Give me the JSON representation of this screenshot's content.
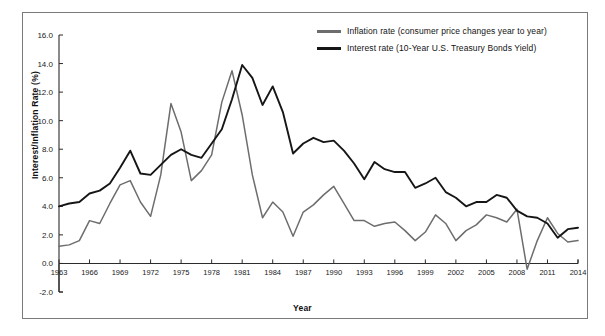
{
  "figure": {
    "background": "#ffffff",
    "border_color": "#7a7a7a",
    "top_ghost_text": ""
  },
  "axis_titles": {
    "y": "Interest/Inflation Rate (%)",
    "x": "Year"
  },
  "legend": {
    "position": "top-right-inside",
    "entries": [
      {
        "name": "inflation",
        "label": "Inflation rate (consumer price changes year to year)",
        "color": "#6d6d6d"
      },
      {
        "name": "interest",
        "label": "Interest rate (10-Year U.S. Treasury Bonds Yield)",
        "color": "#161616"
      }
    ]
  },
  "chart_data": {
    "type": "line",
    "title": "",
    "subtitle": "",
    "xlabel": "Year",
    "ylabel": "Interest/Inflation Rate (%)",
    "xlim": [
      1963,
      2014
    ],
    "ylim": [
      -2.0,
      16.0
    ],
    "ytick_labels": [
      "16.0",
      "14.0",
      "12.0",
      "10.0",
      "8.0",
      "6.0",
      "4.0",
      "2.0",
      "0.0",
      "-2.0"
    ],
    "yticks": [
      16.0,
      14.0,
      12.0,
      10.0,
      8.0,
      6.0,
      4.0,
      2.0,
      0.0,
      -2.0
    ],
    "xtick_labels": [
      "1963",
      "1966",
      "1969",
      "1972",
      "1975",
      "1978",
      "1981",
      "1984",
      "1987",
      "1990",
      "1993",
      "1996",
      "1999",
      "2002",
      "2005",
      "2008",
      "2011",
      "2014"
    ],
    "xticks": [
      1963,
      1966,
      1969,
      1972,
      1975,
      1978,
      1981,
      1984,
      1987,
      1990,
      1993,
      1996,
      1999,
      2002,
      2005,
      2008,
      2011,
      2014
    ],
    "grid": false,
    "legend_position": "top-right",
    "x": [
      1963,
      1964,
      1965,
      1966,
      1967,
      1968,
      1969,
      1970,
      1971,
      1972,
      1973,
      1974,
      1975,
      1976,
      1977,
      1978,
      1979,
      1980,
      1981,
      1982,
      1983,
      1984,
      1985,
      1986,
      1987,
      1988,
      1989,
      1990,
      1991,
      1992,
      1993,
      1994,
      1995,
      1996,
      1997,
      1998,
      1999,
      2000,
      2001,
      2002,
      2003,
      2004,
      2005,
      2006,
      2007,
      2008,
      2009,
      2010,
      2011,
      2012,
      2013,
      2014
    ],
    "series": [
      {
        "name": "Inflation rate (consumer price changes year to year)",
        "color": "#6d6d6d",
        "values": [
          1.2,
          1.3,
          1.6,
          3.0,
          2.8,
          4.2,
          5.5,
          5.8,
          4.3,
          3.3,
          6.2,
          11.2,
          9.2,
          5.8,
          6.5,
          7.6,
          11.3,
          13.5,
          10.4,
          6.2,
          3.2,
          4.3,
          3.6,
          1.9,
          3.6,
          4.1,
          4.8,
          5.4,
          4.2,
          3.0,
          3.0,
          2.6,
          2.8,
          2.9,
          2.3,
          1.6,
          2.2,
          3.4,
          2.8,
          1.6,
          2.3,
          2.7,
          3.4,
          3.2,
          2.9,
          3.8,
          -0.4,
          1.6,
          3.2,
          2.1,
          1.5,
          1.6
        ]
      },
      {
        "name": "Interest rate (10-Year U.S. Treasury Bonds Yield)",
        "color": "#161616",
        "values": [
          4.0,
          4.2,
          4.3,
          4.9,
          5.1,
          5.6,
          6.7,
          7.9,
          6.3,
          6.2,
          6.9,
          7.6,
          8.0,
          7.6,
          7.4,
          8.4,
          9.4,
          11.5,
          13.9,
          13.0,
          11.1,
          12.4,
          10.6,
          7.7,
          8.4,
          8.8,
          8.5,
          8.6,
          7.9,
          7.0,
          5.9,
          7.1,
          6.6,
          6.4,
          6.4,
          5.3,
          5.6,
          6.0,
          5.0,
          4.6,
          4.0,
          4.3,
          4.3,
          4.8,
          4.6,
          3.7,
          3.3,
          3.2,
          2.8,
          1.8,
          2.4,
          2.5
        ]
      }
    ]
  }
}
